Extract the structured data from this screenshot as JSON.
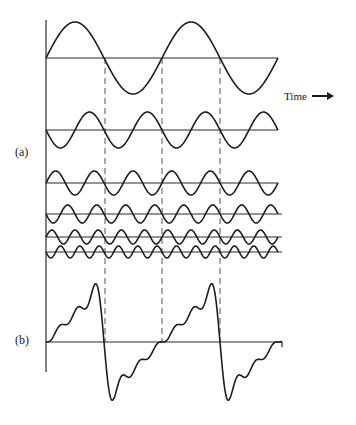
{
  "labels": {
    "a": "(a)",
    "b": "(b)",
    "time": "Time"
  },
  "colors": {
    "stroke": "#1e1e1e",
    "axis": "#2a2a2a",
    "dash": "#555555"
  },
  "layout": {
    "axis_x": 46,
    "axis_top": 20,
    "axis_bottom": 372,
    "x_start": 46,
    "x_end": 278,
    "fundamental_period_px": 116,
    "dashed_lines_x": [
      105,
      162,
      220
    ],
    "dashed_top": 58,
    "dashed_bottom": 342
  },
  "chart_data": {
    "type": "line",
    "xlabel": "Time",
    "series": [
      {
        "name": "harmonic-1",
        "harmonic": 1,
        "baseline_y": 58,
        "amplitude_px": 36,
        "sign": 1
      },
      {
        "name": "harmonic-2",
        "harmonic": 2,
        "baseline_y": 130,
        "amplitude_px": 18,
        "sign": -1
      },
      {
        "name": "harmonic-3",
        "harmonic": 3,
        "baseline_y": 183,
        "amplitude_px": 12,
        "sign": 1
      },
      {
        "name": "harmonic-4",
        "harmonic": 4,
        "baseline_y": 214,
        "amplitude_px": 9,
        "sign": -1
      },
      {
        "name": "harmonic-5",
        "harmonic": 5,
        "baseline_y": 237,
        "amplitude_px": 7,
        "sign": 1
      },
      {
        "name": "harmonic-6",
        "harmonic": 6,
        "baseline_y": 252,
        "amplitude_px": 6,
        "sign": -1
      }
    ],
    "sum": {
      "name": "sum-waveform",
      "baseline_y": 342,
      "scale": 1.0,
      "peak_y": 277,
      "trough_y": 398
    }
  }
}
